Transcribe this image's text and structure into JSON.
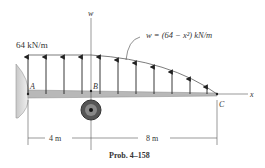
{
  "diagram": {
    "load_label": "64 kN/m",
    "equation_label": "w = (64 − x²) kN/m",
    "axis_w": "w",
    "axis_x": "x",
    "point_a": "A",
    "point_b": "B",
    "point_c": "C",
    "dim_ab": "4 m",
    "dim_bc": "8 m",
    "caption": "Prob. 4–158"
  }
}
